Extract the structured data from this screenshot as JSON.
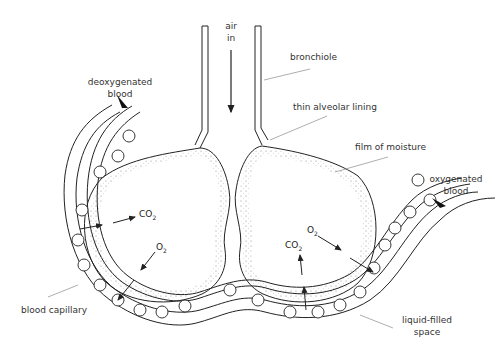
{
  "diagram": {
    "labels": {
      "air_in_1": "air",
      "air_in_2": "in",
      "bronchiole": "bronchiole",
      "thin_alveolar_lining": "thin alveolar lining",
      "film_of_moisture": "film of moisture",
      "deoxygenated_1": "deoxygenated",
      "deoxygenated_2": "blood",
      "oxygenated_1": "oxygenated",
      "oxygenated_2": "blood",
      "blood_capillary": "blood capillary",
      "liquid_filled_1": "liquid-filled",
      "liquid_filled_2": "space"
    },
    "gases": {
      "left_co2": "CO",
      "left_o2": "O",
      "right_co2": "CO",
      "right_o2": "O",
      "sub_2": "2"
    },
    "colors": {
      "line": "#222222",
      "label": "#333333",
      "leader": "#999999"
    }
  }
}
